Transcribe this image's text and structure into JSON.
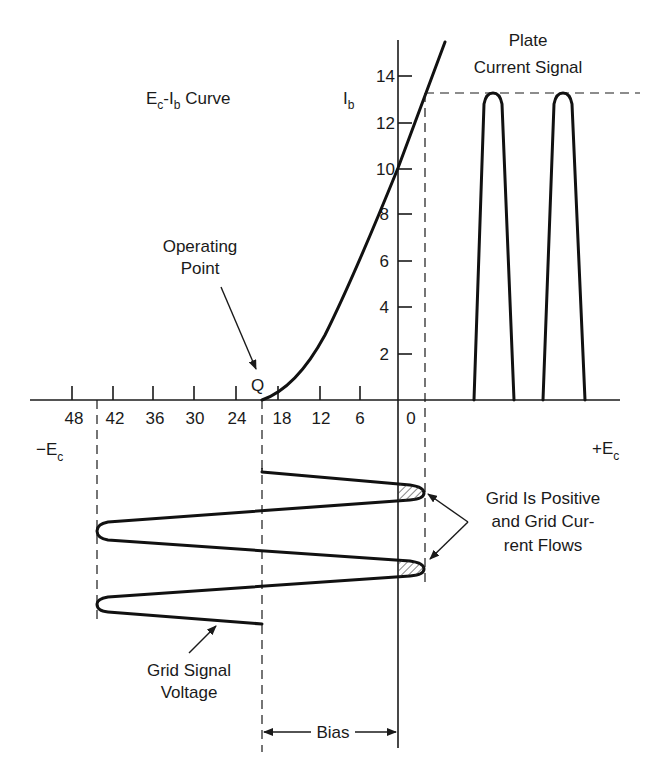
{
  "title": "Ec-Ib Curve",
  "curve_label": {
    "main": "E",
    "sub1": "c",
    "dash": "-I",
    "sub2": "b",
    "tail": " Curve"
  },
  "y_axis": {
    "label_main": "I",
    "label_sub": "b",
    "ticks": [
      "14",
      "12",
      "10",
      "8",
      "6",
      "4",
      "2"
    ]
  },
  "x_axis": {
    "ticks": [
      "48",
      "42",
      "36",
      "30",
      "24",
      "18",
      "12",
      "6",
      "0"
    ],
    "neg_label_main": "−E",
    "neg_label_sub": "c",
    "pos_label_main": "+E",
    "pos_label_sub": "c"
  },
  "annotations": {
    "plate_current_line1": "Plate",
    "plate_current_line2": "Current Signal",
    "operating_point_line1": "Operating",
    "operating_point_line2": "Point",
    "q_label": "Q",
    "grid_positive_line1": "Grid Is Positive",
    "grid_positive_line2": "and Grid Cur-",
    "grid_positive_line3": "rent Flows",
    "grid_signal_line1": "Grid Signal",
    "grid_signal_line2": "Voltage",
    "bias": "Bias"
  },
  "colors": {
    "ink": "#1a1a1a",
    "background": "#ffffff"
  }
}
